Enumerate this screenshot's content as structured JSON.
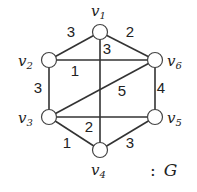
{
  "graph": {
    "name_prefix": ":",
    "name": "G",
    "vertices": [
      {
        "id": "v1",
        "letter": "v",
        "sub": "1",
        "x": 100,
        "y": 32,
        "lx": 91,
        "ly": 12
      },
      {
        "id": "v2",
        "letter": "v",
        "sub": "2",
        "x": 49,
        "y": 60,
        "lx": 18,
        "ly": 62
      },
      {
        "id": "v3",
        "letter": "v",
        "sub": "3",
        "x": 49,
        "y": 117,
        "lx": 18,
        "ly": 119
      },
      {
        "id": "v4",
        "letter": "v",
        "sub": "4",
        "x": 100,
        "y": 150,
        "lx": 91,
        "ly": 171
      },
      {
        "id": "v5",
        "letter": "v",
        "sub": "5",
        "x": 155,
        "y": 117,
        "lx": 167,
        "ly": 119
      },
      {
        "id": "v6",
        "letter": "v",
        "sub": "6",
        "x": 155,
        "y": 60,
        "lx": 167,
        "ly": 62
      }
    ],
    "edges": [
      {
        "from": "v1",
        "to": "v2",
        "weight": "3",
        "wx": 71,
        "wy": 33
      },
      {
        "from": "v1",
        "to": "v6",
        "weight": "2",
        "wx": 130,
        "wy": 33
      },
      {
        "from": "v1",
        "to": "v4",
        "weight": "3",
        "wx": 107,
        "wy": 50
      },
      {
        "from": "v2",
        "to": "v6",
        "weight": "1",
        "wx": 75,
        "wy": 72
      },
      {
        "from": "v2",
        "to": "v3",
        "weight": "3",
        "wx": 38,
        "wy": 89
      },
      {
        "from": "v3",
        "to": "v6",
        "weight": "5",
        "wx": 122,
        "wy": 92
      },
      {
        "from": "v6",
        "to": "v5",
        "weight": "4",
        "wx": 161,
        "wy": 89
      },
      {
        "from": "v3",
        "to": "v5",
        "weight": "2",
        "wx": 89,
        "wy": 128
      },
      {
        "from": "v3",
        "to": "v4",
        "weight": "1",
        "wx": 67,
        "wy": 144
      },
      {
        "from": "v4",
        "to": "v5",
        "weight": "3",
        "wx": 130,
        "wy": 144
      }
    ]
  }
}
